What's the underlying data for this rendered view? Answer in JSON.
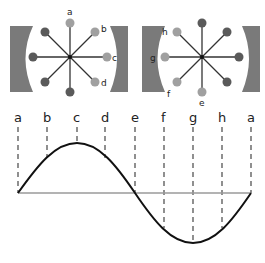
{
  "diagram": {
    "colors": {
      "pole": "#7a7a7a",
      "spoke": "#333333",
      "dot_dark": "#5a5a5a",
      "dot_light": "#a0a0a0",
      "curve": "#111111",
      "baseline": "#9a9a9a",
      "dash": "#555555"
    },
    "left_star": {
      "labels": {
        "a": "a",
        "b": "b",
        "c": "c",
        "d": "d"
      }
    },
    "right_star": {
      "labels": {
        "e": "e",
        "f": "f",
        "g": "g",
        "h": "h"
      }
    },
    "wave": {
      "labels": [
        "a",
        "b",
        "c",
        "d",
        "e",
        "f",
        "g",
        "h",
        "a"
      ]
    }
  }
}
